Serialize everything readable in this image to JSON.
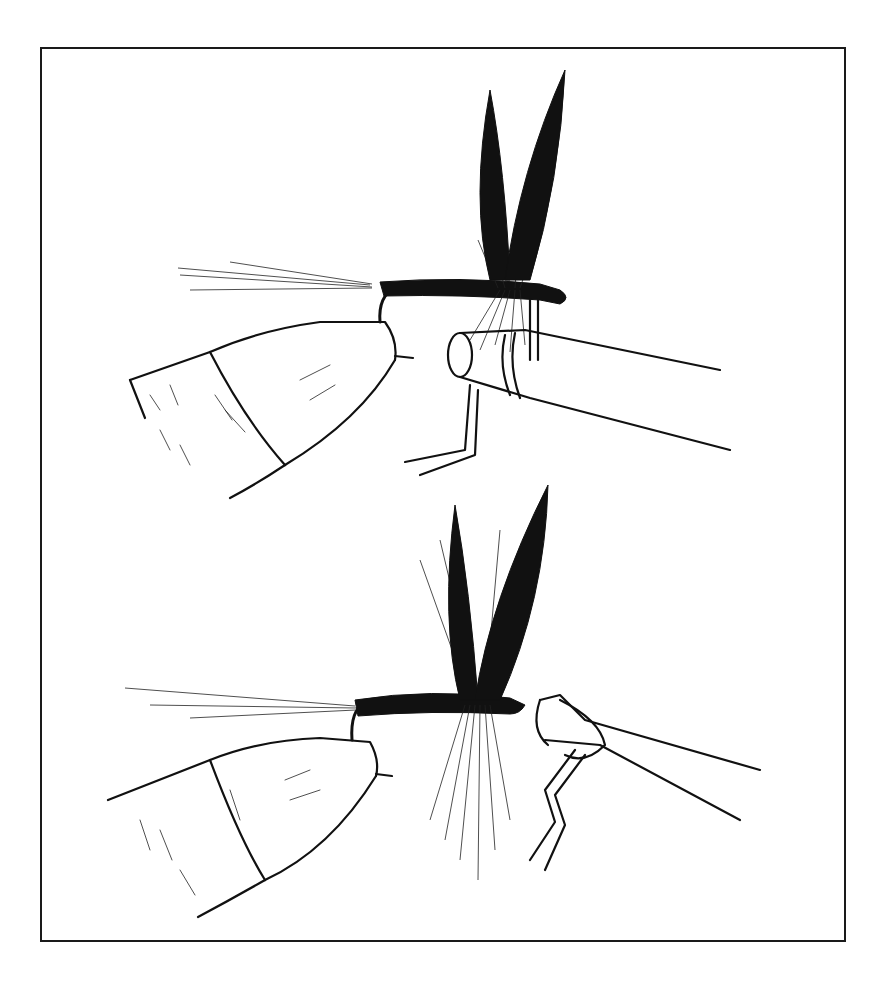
{
  "illustration": {
    "frame_color": "#1a1a1a",
    "ink_color": "#111111",
    "background": "#ffffff",
    "panels": [
      {
        "id": "top",
        "subject": "dry fly on hook held in vise jaws, whip-finish tool at eye"
      },
      {
        "id": "bottom",
        "subject": "dry fly on hook held in vise jaws, whip-finish loop around hook eye"
      }
    ]
  }
}
